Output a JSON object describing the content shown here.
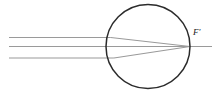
{
  "figure": {
    "name": "spherical-refracting-surface-focal-diagram",
    "background_color": "#ffffff",
    "labels": {
      "focal_point": "F′"
    },
    "colors": {
      "surface_stroke": "#2b2b2b",
      "ray_stroke": "#9a9a9a",
      "axis_stroke": "#9a9a9a",
      "label_color": "#1a1a1a"
    }
  },
  "chart_data": {
    "type": "diagram",
    "title": "",
    "xlabel": "",
    "ylabel": "",
    "coordinate_space": {
      "width": 218,
      "height": 97,
      "units": "px",
      "y_axis_direction": "down"
    },
    "grid": false,
    "legend": null,
    "sphere": {
      "name": "refracting-spherical-surface",
      "center_x": 148,
      "center_y": 46.5,
      "radius": 42,
      "left_vertex_x": 106,
      "right_vertex_x": 190,
      "top_y": 4.5,
      "bottom_y": 88.5,
      "stroke": "#2b2b2b",
      "stroke_width": 1.5,
      "fill": "none"
    },
    "focal_point": {
      "name": "focal-point",
      "label": "F′",
      "x": 190,
      "y": 46.5,
      "label_x": 193,
      "label_y": 35
    },
    "optical_axis": {
      "name": "optical-axis",
      "y": 46.5,
      "x_start": 9,
      "x_end": 212,
      "stroke": "#9a9a9a",
      "stroke_width": 1.1
    },
    "incident_rays": [
      {
        "name": "ray-upper",
        "y": 37.5,
        "x_start": 9,
        "x_incidence": 110.7,
        "y_incidence": 37.5
      },
      {
        "name": "ray-axial",
        "y": 46.5,
        "x_start": 9,
        "x_incidence": 106.0,
        "y_incidence": 46.5
      },
      {
        "name": "ray-lower",
        "y": 58.0,
        "x_start": 9,
        "x_incidence": 113.9,
        "y_incidence": 58.0
      }
    ],
    "refracted_rays": [
      {
        "name": "refracted-ray-upper",
        "from_x": 110.7,
        "from_y": 37.5,
        "to_x": 190,
        "to_y": 46.5
      },
      {
        "name": "refracted-ray-axial",
        "from_x": 106.0,
        "from_y": 46.5,
        "to_x": 190,
        "to_y": 46.5
      },
      {
        "name": "refracted-ray-lower",
        "from_x": 113.9,
        "from_y": 58.0,
        "to_x": 190,
        "to_y": 46.5
      }
    ]
  }
}
